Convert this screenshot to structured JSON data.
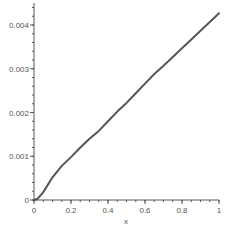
{
  "chart_data": {
    "type": "line",
    "title": "",
    "xlabel": "x",
    "ylabel": "",
    "xlim": [
      0,
      1
    ],
    "ylim": [
      0,
      0.0043
    ],
    "grid": false,
    "legend": null,
    "x_ticks": [
      0,
      0.2,
      0.4,
      0.6,
      0.8,
      1
    ],
    "x_tick_labels": [
      "0",
      "0.2",
      "0.4",
      "0.6",
      "0.8",
      "1"
    ],
    "y_ticks": [
      0,
      0.001,
      0.002,
      0.003,
      0.004
    ],
    "y_tick_labels": [
      "0",
      "0.001",
      "0.002",
      "0.003",
      "0.004"
    ],
    "series": [
      {
        "name": "curve",
        "color": "#555555",
        "x": [
          0,
          0.02,
          0.05,
          0.1,
          0.15,
          0.2,
          0.25,
          0.3,
          0.35,
          0.4,
          0.45,
          0.5,
          0.55,
          0.6,
          0.65,
          0.7,
          0.75,
          0.8,
          0.85,
          0.9,
          0.95,
          1.0
        ],
        "y": [
          0,
          3e-05,
          0.00018,
          0.00052,
          0.00078,
          0.00098,
          0.0012,
          0.0014,
          0.00158,
          0.0018,
          0.00202,
          0.00222,
          0.00244,
          0.00266,
          0.00288,
          0.00307,
          0.00327,
          0.00347,
          0.00367,
          0.00387,
          0.00407,
          0.00427
        ]
      }
    ]
  },
  "axes": {
    "xlabel": "x"
  }
}
